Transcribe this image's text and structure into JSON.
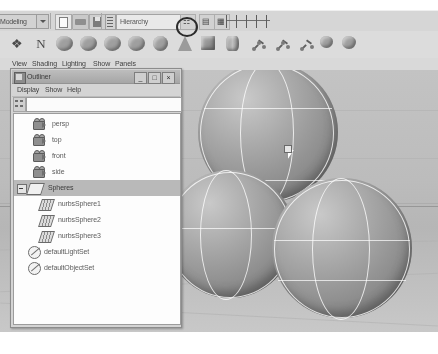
{
  "app": {
    "name": "Autodesk Maya",
    "window_title": "Outliner"
  },
  "toolbar": {
    "menu_set_value": "Modeling",
    "menu_set_icon": "chevron-down-icon",
    "file_buttons": [
      {
        "name": "new-scene-button",
        "icon": "new-file-icon"
      },
      {
        "name": "open-scene-button",
        "icon": "open-folder-icon"
      },
      {
        "name": "save-scene-button",
        "icon": "save-disk-icon"
      }
    ],
    "selection_mask_label": "Hierarchy",
    "selection_mask_icon": "list-icon",
    "mode_buttons": [
      {
        "name": "snap-to-grid-button",
        "icon": "magnet-icon",
        "annotated": true
      },
      {
        "name": "snap-to-curve-button",
        "icon": "curve-snap-icon"
      },
      {
        "name": "snap-to-point-button",
        "icon": "point-snap-icon"
      }
    ],
    "annotation": {
      "type": "circle-highlight",
      "target": "snap-to-grid-button"
    },
    "slider_ticks": 5
  },
  "shelf": {
    "items": [
      {
        "name": "shelf-item-construction-plane",
        "icon": "axes-icon",
        "glyph": "✶"
      },
      {
        "name": "shelf-item-nurbs-curve",
        "icon": "curve-n-icon",
        "glyph": "N"
      },
      {
        "name": "shelf-item-blob-1",
        "icon": "organic-shape-icon"
      },
      {
        "name": "shelf-item-blob-2",
        "icon": "organic-shape-icon"
      },
      {
        "name": "shelf-item-blob-3",
        "icon": "organic-shape-icon"
      },
      {
        "name": "shelf-item-plane",
        "icon": "nurbs-plane-icon"
      },
      {
        "name": "shelf-item-nurbs-sphere",
        "icon": "nurbs-sphere-icon"
      },
      {
        "name": "shelf-item-nurbs-cone",
        "icon": "nurbs-cone-icon"
      },
      {
        "name": "shelf-item-nurbs-cube",
        "icon": "nurbs-cube-icon"
      },
      {
        "name": "shelf-item-nurbs-cylinder",
        "icon": "nurbs-cylinder-icon"
      },
      {
        "name": "shelf-item-joint-chain",
        "icon": "joint-chain-icon"
      },
      {
        "name": "shelf-item-ik-handle",
        "icon": "ik-handle-icon"
      },
      {
        "name": "shelf-item-ik-spline",
        "icon": "ik-spline-icon"
      },
      {
        "name": "shelf-item-skin-bind",
        "icon": "skin-bind-icon"
      },
      {
        "name": "shelf-item-deformer",
        "icon": "deformer-icon"
      }
    ]
  },
  "viewport_menu": {
    "items": [
      "View",
      "Shading",
      "Lighting",
      "Show",
      "Panels"
    ]
  },
  "outliner": {
    "title": "Outliner",
    "title_icon": "outliner-window-icon",
    "window_buttons": [
      {
        "name": "minimize-button",
        "label": "_"
      },
      {
        "name": "maximize-button",
        "label": "□"
      },
      {
        "name": "close-button",
        "label": "×"
      }
    ],
    "menus": [
      "Display",
      "Show",
      "Help"
    ],
    "filter": {
      "value": "",
      "placeholder": "",
      "icon": "filter-icon"
    },
    "tree": [
      {
        "label": "persp",
        "icon": "camera-icon",
        "indent": 0,
        "selected": false,
        "expandable": false
      },
      {
        "label": "top",
        "icon": "camera-icon",
        "indent": 0,
        "selected": false,
        "expandable": false
      },
      {
        "label": "front",
        "icon": "camera-icon",
        "indent": 0,
        "selected": false,
        "expandable": false
      },
      {
        "label": "side",
        "icon": "camera-icon",
        "indent": 0,
        "selected": false,
        "expandable": false
      },
      {
        "label": "Spheres",
        "icon": "group-icon",
        "indent": 0,
        "selected": true,
        "expandable": true
      },
      {
        "label": "nurbsSphere1",
        "icon": "nurbs-surface-icon",
        "indent": 1,
        "selected": false,
        "expandable": false
      },
      {
        "label": "nurbsSphere2",
        "icon": "nurbs-surface-icon",
        "indent": 1,
        "selected": false,
        "expandable": false
      },
      {
        "label": "nurbsSphere3",
        "icon": "nurbs-surface-icon",
        "indent": 1,
        "selected": false,
        "expandable": false
      },
      {
        "label": "defaultLightSet",
        "icon": "set-icon",
        "indent": 0,
        "selected": false,
        "expandable": false
      },
      {
        "label": "defaultObjectSet",
        "icon": "set-icon",
        "indent": 0,
        "selected": false,
        "expandable": false
      }
    ]
  },
  "viewport": {
    "objects": [
      {
        "name": "nurbsSphere-top",
        "shape": "sphere"
      },
      {
        "name": "nurbsSphere-left",
        "shape": "sphere"
      },
      {
        "name": "nurbsSphere-right",
        "shape": "sphere"
      }
    ],
    "cursor": {
      "name": "mouse-cursor",
      "x": 288,
      "y": 80
    },
    "grid": true
  },
  "colors": {
    "window_bg": "#d4d4d4",
    "viewport_bg": "#bdbdbd",
    "selection_highlight": "#b9b9b9",
    "wireframe": "#ffffff",
    "annotation": "#2b2b2b"
  }
}
